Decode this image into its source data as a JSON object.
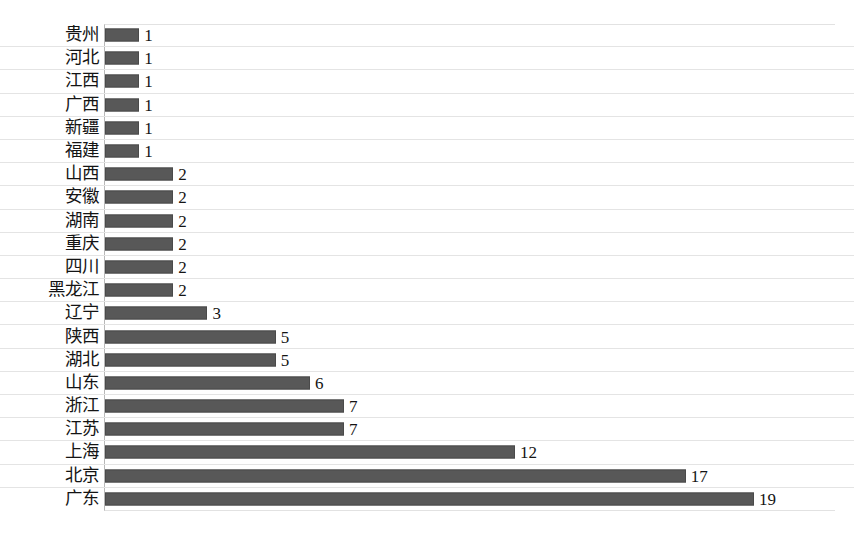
{
  "chart_data": {
    "type": "bar",
    "orientation": "horizontal",
    "title": "",
    "subtitle": "",
    "xlabel": "",
    "ylabel": "",
    "xlim": [
      0,
      21.4
    ],
    "ylim": null,
    "grid": true,
    "grid_axis": "y",
    "legend": false,
    "legend_position": "none",
    "show_value_labels": true,
    "sort_order": "ascending-top-to-bottom",
    "categories": [
      "贵州",
      "河北",
      "江西",
      "广西",
      "新疆",
      "福建",
      "山西",
      "安徽",
      "湖南",
      "重庆",
      "四川",
      "黑龙江",
      "辽宁",
      "陕西",
      "湖北",
      "山东",
      "浙江",
      "江苏",
      "上海",
      "北京",
      "广东"
    ],
    "values": [
      1,
      1,
      1,
      1,
      1,
      1,
      2,
      2,
      2,
      2,
      2,
      2,
      3,
      5,
      5,
      6,
      7,
      7,
      12,
      17,
      19
    ],
    "value_labels": [
      "1",
      "1",
      "1",
      "1",
      "1",
      "1",
      "2",
      "2",
      "2",
      "2",
      "2",
      "2",
      "3",
      "5",
      "5",
      "6",
      "7",
      "7",
      "12",
      "17",
      "19"
    ],
    "series": [
      {
        "name": "",
        "values": [
          1,
          1,
          1,
          1,
          1,
          1,
          2,
          2,
          2,
          2,
          2,
          2,
          3,
          5,
          5,
          6,
          7,
          7,
          12,
          17,
          19
        ]
      }
    ],
    "tick_labels_y": [
      "贵州",
      "河北",
      "江西",
      "广西",
      "新疆",
      "福建",
      "山西",
      "安徽",
      "湖南",
      "重庆",
      "四川",
      "黑龙江",
      "辽宁",
      "陕西",
      "湖北",
      "山东",
      "浙江",
      "江苏",
      "上海",
      "北京",
      "广东"
    ],
    "tick_labels_x": [],
    "annotations": []
  },
  "style": {
    "bar_color": "#585858",
    "bar_border_color": "#4a4a4a",
    "grid_color": "#e4e4e4",
    "axis_color": "#b8b8b8",
    "text_color": "#141414",
    "background": "#ffffff"
  }
}
